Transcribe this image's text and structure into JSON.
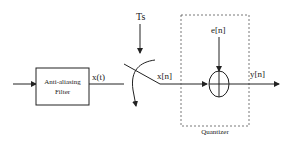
{
  "diagram": {
    "filter_block": {
      "line1": "Anti-aliasing",
      "line2": "Filter"
    },
    "signals": {
      "continuous": "x(t)",
      "sample_period": "Ts",
      "sampled": "x[n]",
      "error": "e[n]",
      "output": "y[n]"
    },
    "quantizer_label": "Quantizer",
    "colors": {
      "stroke": "#222222",
      "dashed": "#555555",
      "background": "#ffffff"
    }
  }
}
